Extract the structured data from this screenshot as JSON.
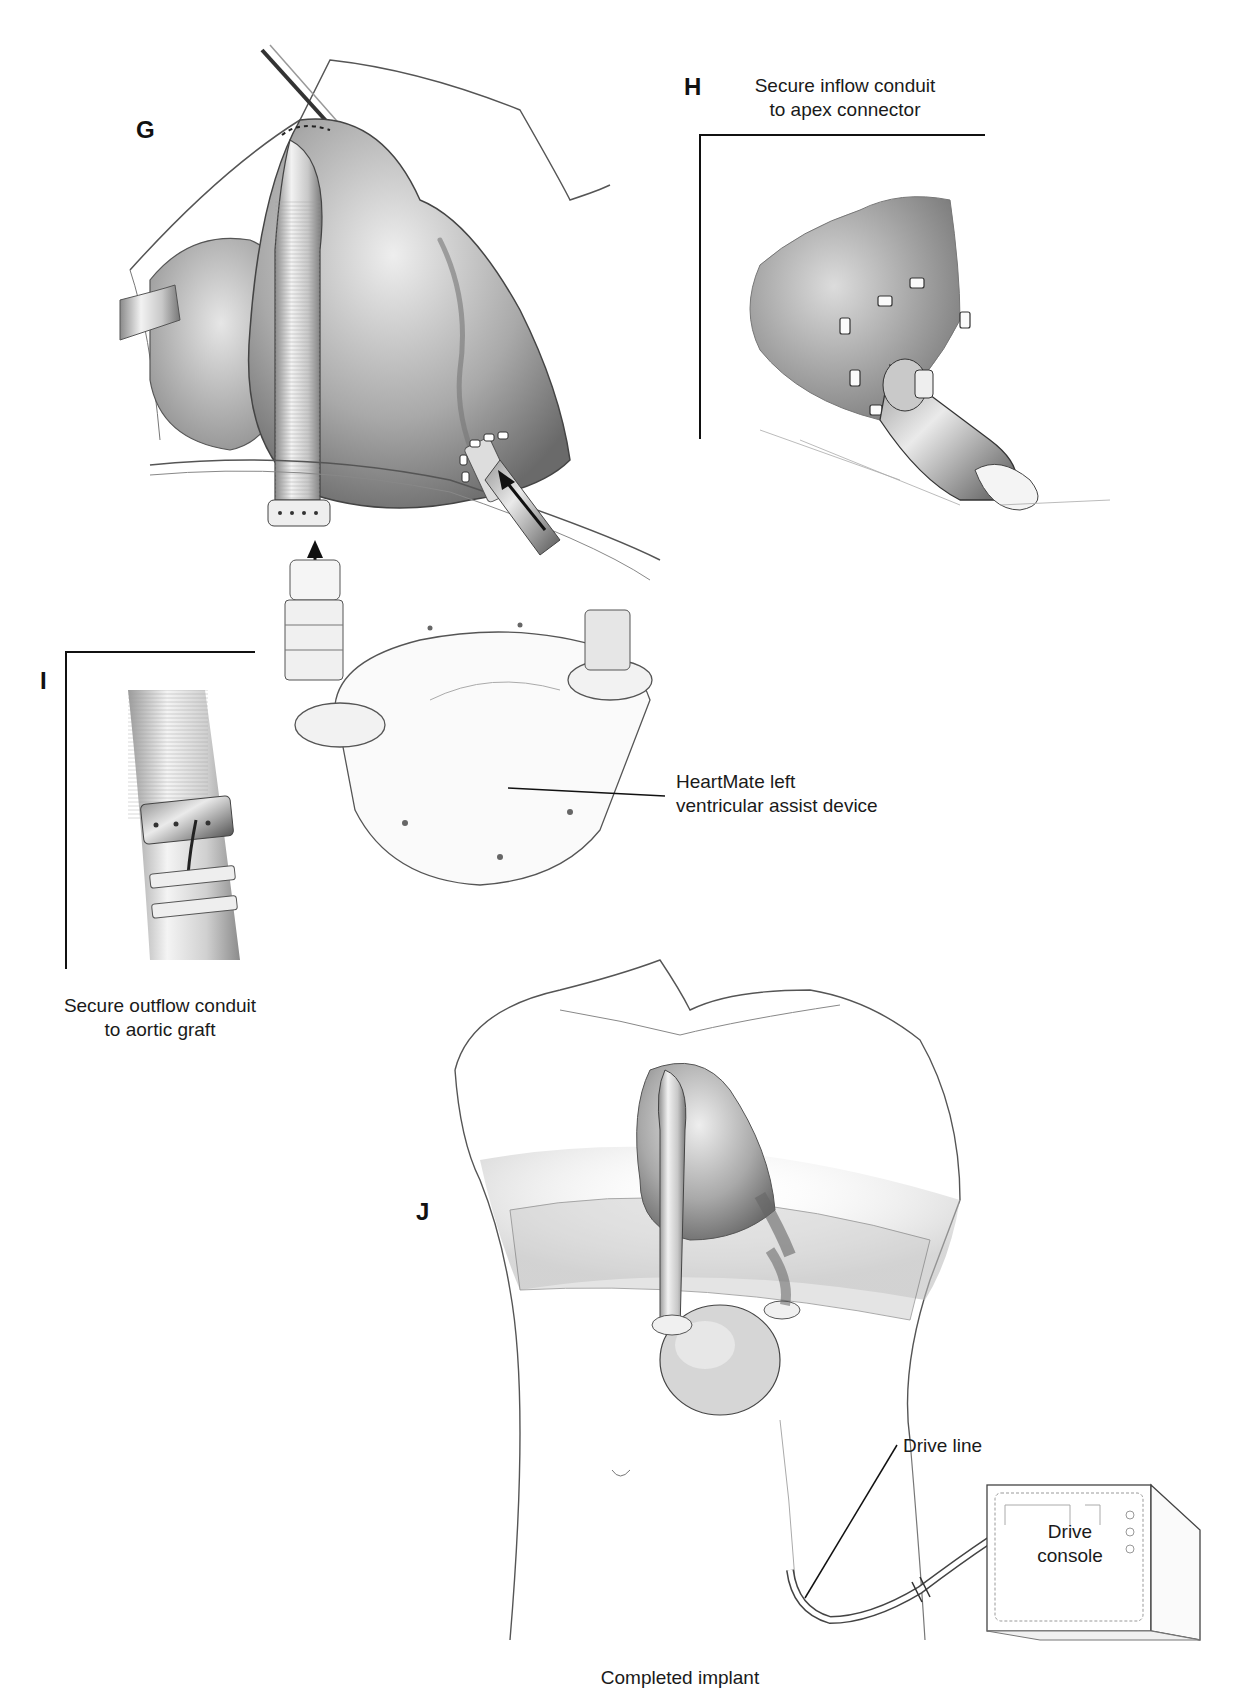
{
  "figure": {
    "panels": {
      "G": {
        "letter": "G"
      },
      "H": {
        "letter": "H",
        "caption_line1": "Secure inflow conduit",
        "caption_line2": "to apex connector"
      },
      "I": {
        "letter": "I",
        "caption_line1": "Secure outflow conduit",
        "caption_line2": "to aortic graft"
      },
      "J": {
        "letter": "J",
        "caption": "Completed implant"
      }
    },
    "labels": {
      "device_line1": "HeartMate left",
      "device_line2": "ventricular assist device",
      "drive_line": "Drive line",
      "console_line1": "Drive",
      "console_line2": "console"
    },
    "colors": {
      "ink": "#111111",
      "shade_dark": "#6e6e6e",
      "shade_mid": "#a8a8a8",
      "shade_light": "#d9d9d9",
      "background": "#ffffff"
    }
  }
}
